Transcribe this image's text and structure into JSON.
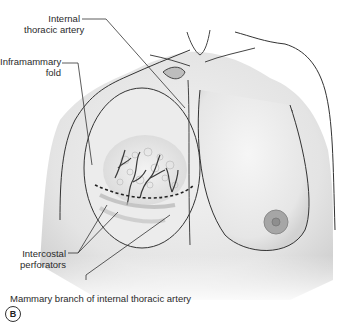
{
  "figure": {
    "panel_label": "B",
    "labels": {
      "internal_thoracic_artery_line1": "Internal",
      "internal_thoracic_artery_line2": "thoracic artery",
      "inframammary_fold_line1": "Inframammary",
      "inframammary_fold_line2": "fold",
      "intercostal_perforators_line1": "Intercostal",
      "intercostal_perforators_line2": "perforators",
      "mammary_branch": "Mammary branch of internal thoracic artery"
    },
    "colors": {
      "skin_fill": "#e8e8e8",
      "outline": "#333333",
      "vessel": "#3a3a3a",
      "nipple": "#9a9a9a",
      "background": "#ffffff"
    }
  }
}
